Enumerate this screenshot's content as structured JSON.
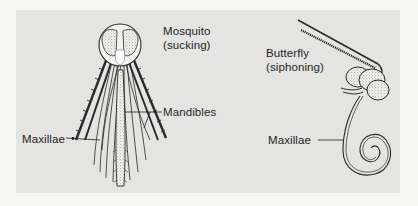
{
  "figure": {
    "background_color": "#f7f7f5",
    "panel_color": "#e4e4e2",
    "ink_color": "#1f1f1f"
  },
  "mosquito": {
    "title": "Mosquito",
    "subtitle": "(sucking)",
    "labels": {
      "mandibles": "Mandibles",
      "maxillae": "Maxillae"
    }
  },
  "butterfly": {
    "title": "Butterfly",
    "subtitle": "(siphoning)",
    "labels": {
      "maxillae": "Maxillae"
    }
  }
}
